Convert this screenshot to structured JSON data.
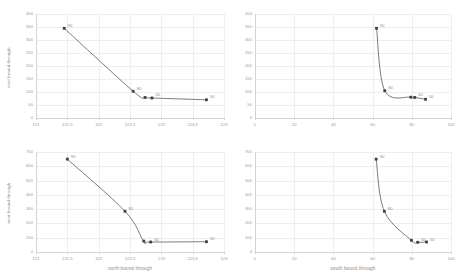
{
  "figure": {
    "background": "#ffffff",
    "line_color": "#595959",
    "marker_color": "#404040",
    "grid_color": "#eeeeee",
    "axis_color": "#d3d3d3",
    "text_color": "#8f8f8f"
  },
  "chart_data": [
    {
      "id": "top-left",
      "type": "line",
      "title": "",
      "xlabel": "",
      "ylabel": "east bound through",
      "xlim": [
        121,
        124
      ],
      "ylim": [
        0,
        400
      ],
      "xticks": [
        "121",
        "121.5",
        "122",
        "122.5",
        "123",
        "123.5",
        "124"
      ],
      "xtick_values": [
        121,
        121.5,
        122,
        122.5,
        123,
        123.5,
        124
      ],
      "yticks": [
        "0",
        "50",
        "100",
        "150",
        "200",
        "250",
        "300",
        "350",
        "400"
      ],
      "ytick_values": [
        0,
        50,
        100,
        150,
        200,
        250,
        300,
        350,
        400
      ],
      "grid": true,
      "legend": "none",
      "points": [
        {
          "x": 121.45,
          "y": 345,
          "label": "90"
        },
        {
          "x": 122.55,
          "y": 103,
          "label": "80"
        },
        {
          "x": 122.74,
          "y": 79,
          "label": ""
        },
        {
          "x": 122.85,
          "y": 77,
          "label": "60"
        },
        {
          "x": 123.72,
          "y": 70,
          "label": "50"
        }
      ]
    },
    {
      "id": "top-right",
      "type": "line",
      "title": "",
      "xlabel": "",
      "ylabel": "",
      "xlim": [
        0,
        100
      ],
      "ylim": [
        0,
        400
      ],
      "xticks": [
        "0",
        "20",
        "40",
        "60",
        "80",
        "100"
      ],
      "xtick_values": [
        0,
        20,
        40,
        60,
        80,
        100
      ],
      "yticks": [
        "0",
        "50",
        "100",
        "150",
        "200",
        "250",
        "300",
        "350",
        "400"
      ],
      "ytick_values": [
        0,
        50,
        100,
        150,
        200,
        250,
        300,
        350,
        400
      ],
      "grid": true,
      "legend": "none",
      "points": [
        {
          "x": 62.0,
          "y": 345,
          "label": "90"
        },
        {
          "x": 66.2,
          "y": 105,
          "label": "80"
        },
        {
          "x": 79.5,
          "y": 80,
          "label": ""
        },
        {
          "x": 81.5,
          "y": 79,
          "label": "60"
        },
        {
          "x": 87.0,
          "y": 72,
          "label": "50"
        }
      ]
    },
    {
      "id": "bottom-left",
      "type": "line",
      "title": "",
      "xlabel": "north bound through",
      "ylabel": "west bound through",
      "xlim": [
        121,
        124
      ],
      "ylim": [
        0,
        700
      ],
      "xticks": [
        "121",
        "121.5",
        "122",
        "122.5",
        "123",
        "123.5",
        "124"
      ],
      "xtick_values": [
        121,
        121.5,
        122,
        122.5,
        123,
        123.5,
        124
      ],
      "yticks": [
        "0",
        "100",
        "200",
        "300",
        "400",
        "500",
        "600",
        "700"
      ],
      "ytick_values": [
        0,
        100,
        200,
        300,
        400,
        500,
        600,
        700
      ],
      "grid": true,
      "legend": "none",
      "points": [
        {
          "x": 121.5,
          "y": 650,
          "label": "90"
        },
        {
          "x": 122.42,
          "y": 285,
          "label": "80"
        },
        {
          "x": 122.72,
          "y": 76,
          "label": ""
        },
        {
          "x": 122.83,
          "y": 70,
          "label": "60"
        },
        {
          "x": 123.72,
          "y": 72,
          "label": "50"
        }
      ]
    },
    {
      "id": "bottom-right",
      "type": "line",
      "title": "",
      "xlabel": "south bound through",
      "ylabel": "",
      "xlim": [
        0,
        100
      ],
      "ylim": [
        0,
        700
      ],
      "xticks": [
        "0",
        "20",
        "40",
        "60",
        "80",
        "100"
      ],
      "xtick_values": [
        0,
        20,
        40,
        60,
        80,
        100
      ],
      "yticks": [
        "0",
        "100",
        "200",
        "300",
        "400",
        "500",
        "600",
        "700"
      ],
      "ytick_values": [
        0,
        100,
        200,
        300,
        400,
        500,
        600,
        700
      ],
      "grid": true,
      "legend": "none",
      "points": [
        {
          "x": 61.8,
          "y": 650,
          "label": "90"
        },
        {
          "x": 66.0,
          "y": 285,
          "label": "80"
        },
        {
          "x": 79.8,
          "y": 82,
          "label": ""
        },
        {
          "x": 83.0,
          "y": 68,
          "label": "60"
        },
        {
          "x": 87.5,
          "y": 70,
          "label": "50"
        }
      ]
    }
  ]
}
